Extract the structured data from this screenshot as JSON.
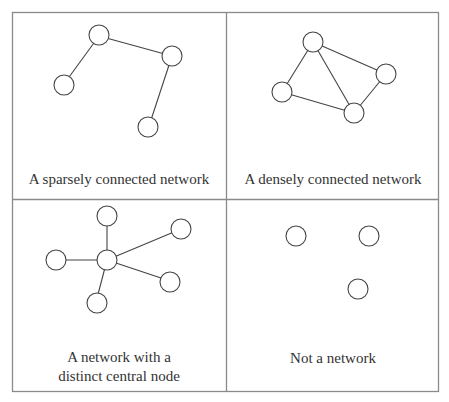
{
  "panels": [
    {
      "id": "sparse",
      "caption_lines": [
        "A sparsely connected network"
      ]
    },
    {
      "id": "dense",
      "caption_lines": [
        "A densely connected network"
      ]
    },
    {
      "id": "central",
      "caption_lines": [
        "A network with a",
        "distinct central node"
      ]
    },
    {
      "id": "none",
      "caption_lines": [
        "Not a network"
      ]
    }
  ],
  "colors": {
    "border": "#888888",
    "stroke": "#444444",
    "background": "#ffffff"
  }
}
